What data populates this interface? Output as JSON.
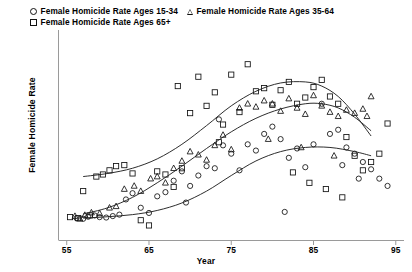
{
  "chart_data": {
    "type": "scatter",
    "title": "",
    "xlabel": "Year",
    "ylabel": "Female Homicide Rate",
    "xlim": [
      54,
      96
    ],
    "ylim": [
      0,
      10
    ],
    "xticks": [
      55,
      65,
      75,
      85,
      95
    ],
    "yticks": [],
    "grid": false,
    "legend_position": "top-left",
    "series": [
      {
        "name": "Female Homicide Rate Ages 15-34",
        "marker": "circle",
        "color": "#111111",
        "points": [
          [
            56.2,
            1.05
          ],
          [
            57.0,
            1.02
          ],
          [
            57.6,
            1.12
          ],
          [
            58.4,
            1.18
          ],
          [
            59.0,
            1.1
          ],
          [
            59.8,
            1.08
          ],
          [
            60.6,
            1.15
          ],
          [
            61.4,
            1.22
          ],
          [
            62.2,
            1.95
          ],
          [
            63.0,
            2.25
          ],
          [
            64.0,
            1.55
          ],
          [
            65.0,
            1.3
          ],
          [
            66.0,
            2.1
          ],
          [
            67.0,
            2.3
          ],
          [
            68.0,
            2.85
          ],
          [
            69.0,
            3.3
          ],
          [
            70.0,
            2.6
          ],
          [
            71.0,
            3.1
          ],
          [
            72.0,
            3.55
          ],
          [
            73.0,
            3.45
          ],
          [
            74.0,
            4.55
          ],
          [
            75.0,
            4.15
          ],
          [
            76.0,
            3.35
          ],
          [
            77.0,
            4.6
          ],
          [
            78.0,
            4.3
          ],
          [
            79.0,
            5.1
          ],
          [
            80.0,
            5.45
          ],
          [
            81.0,
            4.85
          ],
          [
            82.0,
            3.95
          ],
          [
            83.0,
            4.4
          ],
          [
            84.0,
            3.5
          ],
          [
            85.0,
            4.6
          ],
          [
            86.0,
            6.55
          ],
          [
            87.0,
            5.1
          ],
          [
            88.0,
            5.3
          ],
          [
            89.0,
            4.45
          ],
          [
            90.0,
            4.15
          ],
          [
            91.0,
            3.75
          ],
          [
            92.0,
            3.4
          ],
          [
            93.0,
            2.95
          ],
          [
            94.0,
            2.6
          ],
          [
            81.5,
            1.35
          ],
          [
            73.5,
            5.8
          ],
          [
            69.5,
            1.8
          ],
          [
            88.5,
            3.6
          ],
          [
            90.5,
            2.95
          ]
        ]
      },
      {
        "name": "Female Homicide Rate Ages 35-64",
        "marker": "triangle",
        "color": "#111111",
        "points": [
          [
            56.0,
            1.15
          ],
          [
            57.2,
            1.2
          ],
          [
            58.0,
            1.32
          ],
          [
            59.0,
            1.28
          ],
          [
            60.2,
            1.55
          ],
          [
            61.0,
            1.62
          ],
          [
            62.0,
            2.45
          ],
          [
            63.2,
            2.6
          ],
          [
            64.0,
            2.35
          ],
          [
            65.2,
            2.95
          ],
          [
            66.0,
            3.05
          ],
          [
            67.0,
            2.75
          ],
          [
            68.0,
            3.45
          ],
          [
            69.0,
            3.8
          ],
          [
            70.0,
            4.25
          ],
          [
            71.0,
            4.1
          ],
          [
            72.0,
            3.85
          ],
          [
            73.0,
            4.55
          ],
          [
            74.0,
            5.05
          ],
          [
            75.0,
            4.35
          ],
          [
            76.0,
            6.35
          ],
          [
            77.0,
            6.55
          ],
          [
            78.0,
            6.4
          ],
          [
            79.0,
            6.7
          ],
          [
            80.0,
            6.55
          ],
          [
            81.0,
            6.2
          ],
          [
            82.0,
            6.8
          ],
          [
            83.0,
            6.35
          ],
          [
            84.0,
            6.05
          ],
          [
            85.0,
            6.95
          ],
          [
            86.0,
            6.45
          ],
          [
            87.0,
            6.15
          ],
          [
            88.0,
            5.95
          ],
          [
            89.0,
            6.25
          ],
          [
            90.0,
            6.1
          ],
          [
            91.0,
            6.3
          ],
          [
            92.0,
            6.9
          ],
          [
            79.5,
            4.85
          ],
          [
            83.5,
            4.45
          ],
          [
            87.5,
            4.05
          ],
          [
            56.6,
            1.02
          ],
          [
            91.5,
            5.95
          ]
        ]
      },
      {
        "name": "Female Homicide Rate Ages 65+",
        "marker": "square",
        "color": "#111111",
        "points": [
          [
            55.4,
            1.1
          ],
          [
            56.4,
            1.05
          ],
          [
            57.0,
            2.35
          ],
          [
            57.8,
            1.18
          ],
          [
            58.6,
            3.05
          ],
          [
            59.4,
            3.15
          ],
          [
            60.2,
            3.35
          ],
          [
            61.0,
            3.55
          ],
          [
            62.0,
            3.6
          ],
          [
            63.0,
            3.2
          ],
          [
            64.0,
            0.95
          ],
          [
            65.0,
            0.7
          ],
          [
            66.0,
            3.3
          ],
          [
            67.0,
            3.15
          ],
          [
            68.0,
            2.55
          ],
          [
            69.0,
            3.45
          ],
          [
            70.0,
            6.1
          ],
          [
            71.0,
            7.85
          ],
          [
            72.0,
            6.45
          ],
          [
            73.0,
            7.1
          ],
          [
            74.0,
            5.55
          ],
          [
            75.0,
            7.95
          ],
          [
            76.0,
            6.15
          ],
          [
            77.0,
            8.45
          ],
          [
            78.0,
            7.15
          ],
          [
            79.0,
            7.3
          ],
          [
            80.0,
            6.5
          ],
          [
            81.0,
            7.2
          ],
          [
            82.0,
            7.6
          ],
          [
            83.0,
            6.55
          ],
          [
            84.0,
            6.85
          ],
          [
            85.0,
            7.35
          ],
          [
            86.0,
            7.7
          ],
          [
            87.0,
            6.9
          ],
          [
            88.0,
            6.55
          ],
          [
            89.0,
            4.95
          ],
          [
            90.0,
            4.05
          ],
          [
            91.0,
            3.35
          ],
          [
            92.0,
            3.75
          ],
          [
            93.0,
            4.15
          ],
          [
            94.0,
            5.6
          ],
          [
            84.5,
            2.75
          ],
          [
            86.5,
            2.45
          ],
          [
            88.5,
            2.05
          ],
          [
            82.5,
            3.25
          ],
          [
            68.5,
            7.4
          ],
          [
            73.5,
            4.7
          ]
        ]
      }
    ],
    "fitted_curves": [
      {
        "name": "Female Homicide Rate Ages 15-34",
        "marker": "circle",
        "x": [
          57,
          60,
          63,
          66,
          69,
          72,
          75,
          78,
          81,
          84,
          87,
          90,
          92
        ],
        "y": [
          1.05,
          1.12,
          1.22,
          1.42,
          1.78,
          2.35,
          3.1,
          3.8,
          4.25,
          4.45,
          4.45,
          4.25,
          4.05
        ]
      },
      {
        "name": "Female Homicide Rate Ages 35-64",
        "marker": "triangle",
        "x": [
          57,
          60,
          63,
          66,
          69,
          72,
          75,
          78,
          81,
          84,
          86,
          88,
          90,
          92
        ],
        "y": [
          1.25,
          1.55,
          2.05,
          2.75,
          3.55,
          4.4,
          5.2,
          5.85,
          6.3,
          6.55,
          6.55,
          6.35,
          5.9,
          5.25
        ]
      },
      {
        "name": "Female Homicide Rate Ages 65+",
        "marker": "square",
        "x": [
          57,
          60,
          63,
          66,
          69,
          72,
          75,
          78,
          81,
          84,
          86,
          88,
          90,
          92
        ],
        "y": [
          3.05,
          3.2,
          3.45,
          3.9,
          4.6,
          5.5,
          6.45,
          7.15,
          7.55,
          7.6,
          7.4,
          6.9,
          6.05,
          5.0
        ]
      }
    ]
  },
  "legend": {
    "rows": [
      [
        {
          "marker": "circle",
          "label": "Female Homicide Rate Ages 15-34"
        },
        {
          "marker": "triangle",
          "label": "Female Homicide Rate Ages 35-64"
        }
      ],
      [
        {
          "marker": "square",
          "label": "Female Homicide Rate Ages 65+"
        }
      ]
    ]
  },
  "axes": {
    "x_label": "Year",
    "y_label": "Female Homicide Rate",
    "x_tick_labels": [
      "55",
      "65",
      "75",
      "85",
      "95"
    ]
  }
}
